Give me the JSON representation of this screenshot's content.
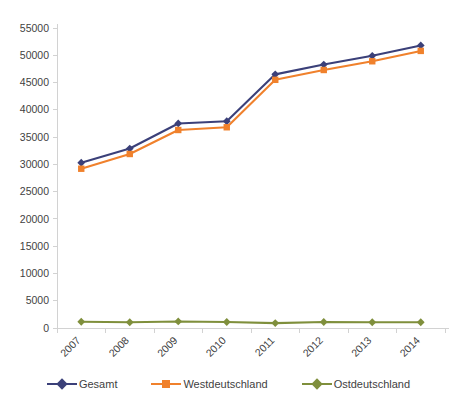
{
  "chart_data": {
    "type": "line",
    "title": "",
    "subtitle": "",
    "xlabel": "",
    "ylabel": "",
    "categories": [
      "2007",
      "2008",
      "2009",
      "2010",
      "2011",
      "2012",
      "2013",
      "2014"
    ],
    "series": [
      {
        "name": "Gesamt",
        "color": "#3b4079",
        "marker": "diamond",
        "values": [
          30300,
          32900,
          37500,
          37900,
          46500,
          48300,
          49900,
          51800
        ]
      },
      {
        "name": "Westdeutschland",
        "color": "#f0812c",
        "marker": "square",
        "values": [
          29200,
          31900,
          36300,
          36800,
          45500,
          47300,
          48900,
          50800
        ]
      },
      {
        "name": "Ostdeutschland",
        "color": "#7f8f3c",
        "marker": "diamond",
        "values": [
          1150,
          1050,
          1200,
          1100,
          900,
          1100,
          1050,
          1050
        ]
      }
    ],
    "ylim": [
      0,
      55000
    ],
    "ytick_step": 5000,
    "yticks": [
      "0",
      "5000",
      "10000",
      "15000",
      "20000",
      "25000",
      "30000",
      "35000",
      "40000",
      "45000",
      "50000",
      "55000"
    ],
    "grid": false,
    "legend_position": "bottom",
    "xtick_rotation_deg": -45,
    "axis_color": "#d2d2d2",
    "text_color": "#3f3f3f",
    "background": "#ffffff"
  },
  "legend": {
    "items": [
      {
        "label": "Gesamt",
        "color": "#3b4079",
        "marker": "diamond"
      },
      {
        "label": "Westdeutschland",
        "color": "#f0812c",
        "marker": "square"
      },
      {
        "label": "Ostdeutschland",
        "color": "#7f8f3c",
        "marker": "diamond"
      }
    ]
  }
}
